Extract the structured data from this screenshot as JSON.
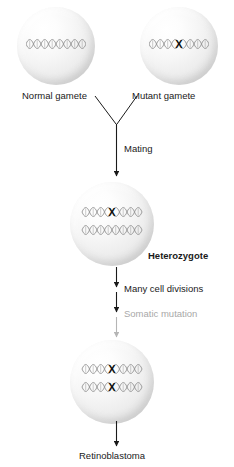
{
  "diagram": {
    "colors": {
      "text": "#1a1a1a",
      "muted_text": "#a8a8a8",
      "arrow": "#1a1a1a",
      "arrow_muted": "#b5b5b5",
      "dna_strand": "#8f8f8f",
      "mutation_marker": "#111111",
      "cell_fill": "#eeeeee"
    },
    "cells": [
      {
        "id": "normal-gamete",
        "label": "Normal gamete",
        "strands": [
          {
            "mutated": false
          }
        ]
      },
      {
        "id": "mutant-gamete",
        "label": "Mutant gamete",
        "strands": [
          {
            "mutated": true
          }
        ]
      },
      {
        "id": "heterozygote",
        "label": "Heterozygote",
        "strands": [
          {
            "mutated": true
          },
          {
            "mutated": false
          }
        ]
      },
      {
        "id": "tumor-cell",
        "label": "",
        "strands": [
          {
            "mutated": true
          },
          {
            "mutated": true
          }
        ]
      }
    ],
    "steps": [
      {
        "id": "mating",
        "label": "Mating",
        "muted": false
      },
      {
        "id": "many-cell-divisions",
        "label": "Many cell divisions",
        "muted": false
      },
      {
        "id": "somatic-mutation",
        "label": "Somatic mutation",
        "muted": true
      }
    ],
    "outcome": {
      "id": "retinoblastoma",
      "label": "Retinoblastoma"
    },
    "mutation_marker_glyph": "X"
  }
}
